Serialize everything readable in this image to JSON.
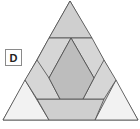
{
  "figure": {
    "label": "D",
    "colors": {
      "stroke": "#4a4a4a",
      "top_triangle": "#cfcfcf",
      "middle_band": "#d4d4d4",
      "inner_hexagon": "#bdbdbd",
      "bottom_band": "#cfcfcf",
      "corner_triangles": "#f2f2f2"
    }
  }
}
